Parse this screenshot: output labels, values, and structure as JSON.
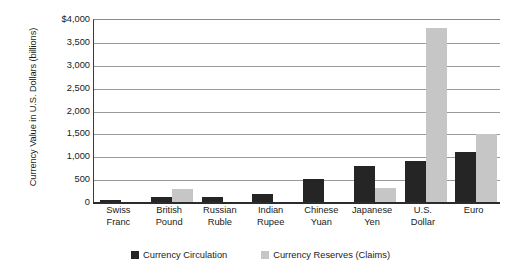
{
  "chart_data": {
    "type": "bar",
    "title": "",
    "xlabel": "",
    "ylabel": "Currency Value in U.S. Dollars (billions)",
    "ylim": [
      0,
      4000
    ],
    "ytick_values": [
      0,
      500,
      1000,
      1500,
      2000,
      2500,
      3000,
      3500,
      4000
    ],
    "ytick_labels": [
      "0",
      "500",
      "1,000",
      "1,500",
      "2,000",
      "2,500",
      "3,000",
      "3,500",
      "$4,000"
    ],
    "grid": true,
    "legend_position": "bottom",
    "categories": [
      "Swiss Franc",
      "British Pound",
      "Russian Ruble",
      "Indian Rupee",
      "Chinese Yuan",
      "Japanese Yen",
      "U.S. Dollar",
      "Euro"
    ],
    "category_lines": [
      [
        "Swiss",
        "Franc"
      ],
      [
        "British",
        "Pound"
      ],
      [
        "Russian",
        "Ruble"
      ],
      [
        "Indian",
        "Rupee"
      ],
      [
        "Chinese",
        "Yuan"
      ],
      [
        "Japanese",
        "Yen"
      ],
      [
        "U.S.",
        "Dollar"
      ],
      [
        "Euro",
        ""
      ]
    ],
    "series": [
      {
        "name": "Currency Circulation",
        "color": "#252525",
        "values": [
          50,
          110,
          100,
          170,
          500,
          790,
          900,
          1100
        ]
      },
      {
        "name": "Currency Reserves (Claims)",
        "color": "#c6c6c6",
        "values": [
          0,
          280,
          0,
          0,
          0,
          300,
          3800,
          1490
        ]
      }
    ]
  },
  "legend": {
    "items": [
      {
        "label": "Currency Circulation",
        "color": "#252525"
      },
      {
        "label": "Currency Reserves (Claims)",
        "color": "#c6c6c6"
      }
    ]
  }
}
